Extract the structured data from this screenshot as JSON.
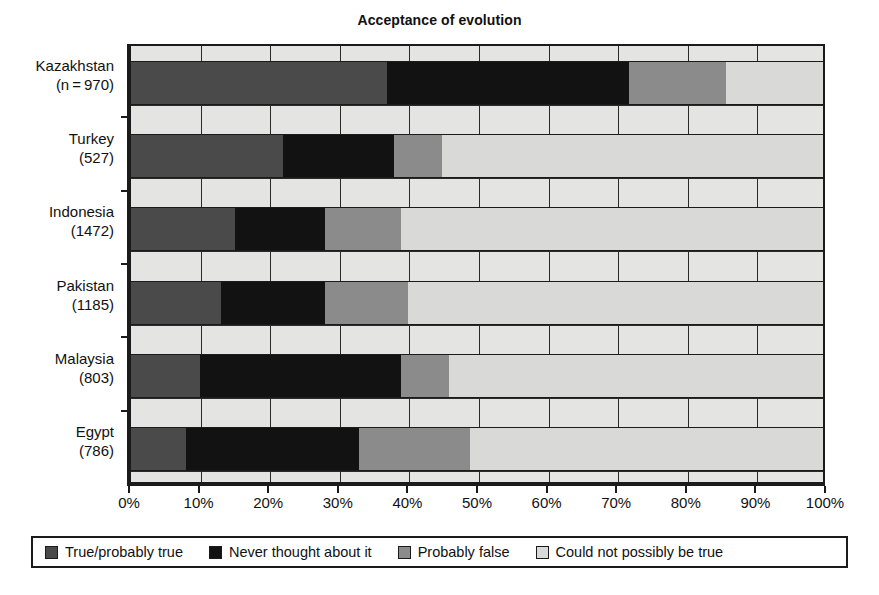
{
  "chart_data": {
    "type": "bar",
    "orientation": "horizontal",
    "stacked": true,
    "normalized_percent": true,
    "title": "Acceptance of evolution",
    "xlabel": "",
    "ylabel": "",
    "xlim": [
      0,
      100
    ],
    "grid": true,
    "legend_position": "bottom",
    "xtick_labels": [
      "0%",
      "10%",
      "20%",
      "30%",
      "40%",
      "50%",
      "60%",
      "70%",
      "80%",
      "90%",
      "100%"
    ],
    "xtick_values": [
      0,
      10,
      20,
      30,
      40,
      50,
      60,
      70,
      80,
      90,
      100
    ],
    "categories": [
      {
        "name": "Kazakhstan",
        "sample_label": "(n = 970)",
        "n": 970
      },
      {
        "name": "Turkey",
        "sample_label": "(527)",
        "n": 527
      },
      {
        "name": "Indonesia",
        "sample_label": "(1472)",
        "n": 1472
      },
      {
        "name": "Pakistan",
        "sample_label": "(1185)",
        "n": 1185
      },
      {
        "name": "Malaysia",
        "sample_label": "(803)",
        "n": 803
      },
      {
        "name": "Egypt",
        "sample_label": "(786)",
        "n": 786
      }
    ],
    "series": [
      {
        "name": "True/probably true",
        "color": "#4a4a4a",
        "values": [
          37,
          22,
          15,
          13,
          10,
          8
        ]
      },
      {
        "name": "Never thought about it",
        "color": "#121212",
        "values": [
          35,
          16,
          13,
          15,
          29,
          25
        ]
      },
      {
        "name": "Probably false",
        "color": "#8b8b8b",
        "values": [
          14,
          7,
          11,
          12,
          7,
          16
        ]
      },
      {
        "name": "Could not possibly be true",
        "color": "#d9d9d7",
        "values": [
          14,
          55,
          61,
          60,
          54,
          51
        ]
      }
    ],
    "cumulative_boundaries_percent": [
      [
        37,
        72,
        86,
        100
      ],
      [
        22,
        38,
        45,
        100
      ],
      [
        15,
        28,
        39,
        100
      ],
      [
        13,
        28,
        40,
        100
      ],
      [
        10,
        39,
        46,
        100
      ],
      [
        8,
        33,
        49,
        100
      ]
    ]
  },
  "legend": {
    "items": [
      {
        "label": "True/probably true",
        "swatch": "s0"
      },
      {
        "label": "Never thought about it",
        "swatch": "s1"
      },
      {
        "label": "Probably false",
        "swatch": "s2"
      },
      {
        "label": "Could not possibly be true",
        "swatch": "s3"
      }
    ]
  }
}
